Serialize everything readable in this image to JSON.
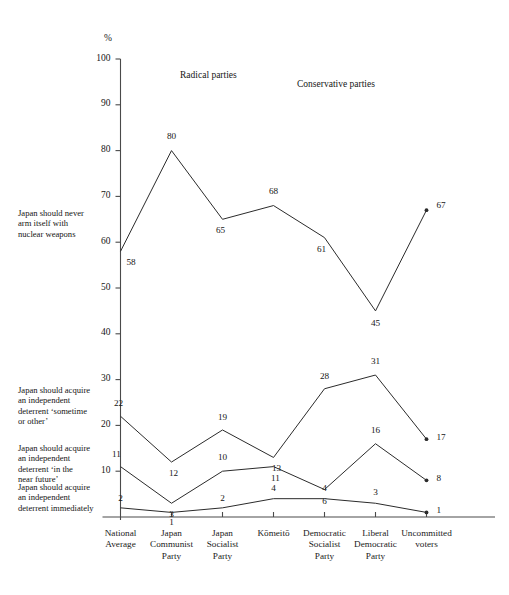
{
  "chart_data": {
    "type": "line",
    "title": "",
    "xlabel": "",
    "ylabel": "%",
    "ylim": [
      0,
      100
    ],
    "yticks": [
      100,
      90,
      80,
      70,
      60,
      50,
      40,
      30,
      20,
      10
    ],
    "grid": false,
    "legend_position": "left-inline",
    "categories": [
      "National Average",
      "Japan Communist Party",
      "Japan Socialist Party",
      "Kōmeitō",
      "Democratic Socialist Party",
      "Liberal Democratic Party",
      "Uncommitted voters"
    ],
    "category_lines": [
      [
        "National",
        "Average"
      ],
      [
        "Japan",
        "Communist",
        "Party"
      ],
      [
        "Japan",
        "Socialist",
        "Party"
      ],
      [
        "Kōmeitō"
      ],
      [
        "Democratic",
        "Socialist",
        "Party"
      ],
      [
        "Liberal",
        "Democratic",
        "Party"
      ],
      [
        "Uncommitted",
        "voters"
      ]
    ],
    "annotations": [
      {
        "text": "Radical parties",
        "at": "upper-left-region"
      },
      {
        "text": "Conservative parties",
        "at": "upper-middle-region"
      }
    ],
    "series": [
      {
        "name": "Japan should never arm itself with nuclear weapons",
        "values": [
          58,
          80,
          65,
          68,
          61,
          45,
          67
        ]
      },
      {
        "name": "Japan should acquire an independent deterrent 'sometime or other'",
        "values": [
          22,
          12,
          19,
          13,
          28,
          31,
          17
        ]
      },
      {
        "name": "Japan should acquire an independent deterrent 'in the near future'",
        "values": [
          11,
          3,
          10,
          11,
          6,
          16,
          8
        ]
      },
      {
        "name": "Japan should acquire an independent deterrent immediately",
        "values": [
          2,
          1,
          2,
          4,
          4,
          3,
          1
        ]
      }
    ]
  },
  "axis": {
    "percent_sign": "%",
    "tick_labels": [
      "100",
      "90",
      "80",
      "70",
      "60",
      "50",
      "40",
      "30",
      "20",
      "10"
    ]
  },
  "headings": {
    "radical": "Radical parties",
    "conservative": "Conservative parties"
  },
  "series_labels": {
    "never": [
      "Japan should never",
      "arm itself with",
      "nuclear weapons"
    ],
    "sometime": [
      "Japan should acquire",
      "an independent",
      "deterrent ‘sometime",
      "or other’"
    ],
    "near_future": [
      "Japan should acquire",
      "an independent",
      "deterrent ‘in the",
      "near future’"
    ],
    "immediately": [
      "Japan should acquire",
      "an independent",
      "deterrent immediately"
    ]
  },
  "colors": {
    "line": "#2b2b2b",
    "axis": "#4a4a4a",
    "text": "#151515",
    "background": "#ffffff"
  }
}
